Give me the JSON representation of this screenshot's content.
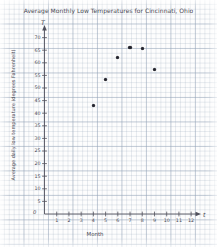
{
  "chart_data": {
    "type": "scatter",
    "title": "Average Monthly Low Temperatures for Cincinnati, Ohio",
    "xlabel": "Month",
    "ylabel": "Average daily low temperature (degrees Fahrenheit)",
    "x_variable_symbol": "t",
    "y_variable_symbol": "T",
    "origin_label": "0",
    "grid": true,
    "legend": "none",
    "xlim": [
      0,
      13
    ],
    "ylim": [
      0,
      72
    ],
    "xticks": [
      1,
      2,
      3,
      4,
      5,
      6,
      7,
      8,
      9,
      10,
      11,
      12
    ],
    "xtick_labels": [
      "1",
      "2",
      "3",
      "4",
      "5",
      "6",
      "7",
      "8",
      "9",
      "10",
      "11",
      "12"
    ],
    "yticks": [
      5,
      10,
      15,
      20,
      25,
      30,
      35,
      40,
      45,
      50,
      55,
      60,
      65,
      70
    ],
    "ytick_labels": [
      "5",
      "10",
      "15",
      "20",
      "25",
      "30",
      "35",
      "40",
      "45",
      "50",
      "55",
      "60",
      "65",
      "70"
    ],
    "x": [
      4,
      5,
      6,
      7,
      8,
      9
    ],
    "values": [
      43,
      53.5,
      62,
      66,
      65.5,
      57.5
    ],
    "points": [
      {
        "month": 4,
        "temperature": 43
      },
      {
        "month": 5,
        "temperature": 53.5
      },
      {
        "month": 6,
        "temperature": 62
      },
      {
        "month": 7,
        "temperature": 66
      },
      {
        "month": 8,
        "temperature": 65.5
      },
      {
        "month": 9,
        "temperature": 57.5
      }
    ],
    "marker_color": "#23232c",
    "axis_color": "#4a4a55",
    "grid_color": "#96a5b9"
  }
}
